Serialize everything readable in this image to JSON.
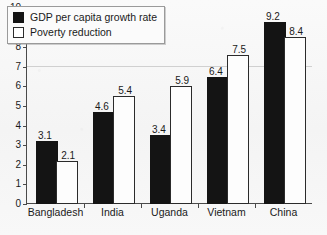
{
  "chart_data": {
    "type": "bar",
    "title": "",
    "subtitle": "",
    "xlabel": "",
    "ylabel": "",
    "categories": [
      "Bangladesh",
      "India",
      "Uganda",
      "Vietnam",
      "China"
    ],
    "series": [
      {
        "name": "GDP per capita growth rate",
        "style": "filled-black",
        "color": "#141414",
        "values": [
          3.1,
          4.6,
          3.4,
          6.4,
          9.2
        ]
      },
      {
        "name": "Poverty reduction",
        "style": "hollow-white",
        "color": "#ffffff",
        "values": [
          2.1,
          5.4,
          5.9,
          7.5,
          8.4
        ]
      }
    ],
    "ylim": [
      0,
      10
    ],
    "ytick_labels": [
      "0",
      "1",
      "2",
      "3",
      "4",
      "5",
      "6",
      "7",
      "8",
      "9",
      "10"
    ],
    "ytick_values": [
      0,
      1,
      2,
      3,
      4,
      5,
      6,
      7,
      8,
      9,
      10
    ],
    "grid": "single faint horizontal line near 7",
    "gridline_values": [
      7
    ],
    "legend_position": "upper-left inside plot",
    "data_labels_shown": true
  },
  "legend": {
    "entries": [
      {
        "label": "GDP per capita growth rate",
        "swatch": "filled-square-icon"
      },
      {
        "label": "Poverty reduction",
        "swatch": "hollow-square-icon"
      }
    ]
  },
  "colors": {
    "series_gdp": "#141414",
    "series_poverty": "#ffffff",
    "outline": "#2b2b2b",
    "axis": "#4a4a4a",
    "background": "#f7f7f7",
    "text": "#1a1a1a"
  }
}
